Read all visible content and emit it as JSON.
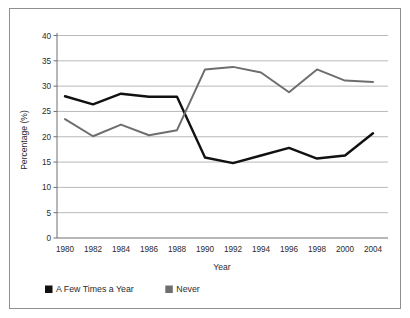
{
  "chart_data": {
    "type": "line",
    "title": "",
    "xlabel": "Year",
    "ylabel": "Percentage (%)",
    "categories": [
      "1980",
      "1982",
      "1984",
      "1986",
      "1988",
      "1990",
      "1992",
      "1994",
      "1996",
      "1998",
      "2000",
      "2004"
    ],
    "x": [
      1980,
      1982,
      1984,
      1986,
      1988,
      1990,
      1992,
      1994,
      1996,
      1998,
      2000,
      2004
    ],
    "series": [
      {
        "name": "A Few Times a Year",
        "color": "#111111",
        "values": [
          28.0,
          26.4,
          28.5,
          27.9,
          27.9,
          15.9,
          14.8,
          16.3,
          17.8,
          15.7,
          16.3,
          20.7
        ]
      },
      {
        "name": "Never",
        "color": "#6e6e6e",
        "values": [
          23.5,
          20.1,
          22.4,
          20.3,
          21.3,
          33.3,
          33.8,
          32.7,
          28.8,
          33.3,
          31.1,
          30.8
        ]
      }
    ],
    "ylim": [
      0,
      40
    ],
    "yticks": [
      0,
      5,
      10,
      15,
      20,
      25,
      30,
      35,
      40
    ],
    "ytick_labels": [
      "0",
      "5",
      "10",
      "15",
      "20",
      "25",
      "30",
      "35",
      "40"
    ],
    "grid": true,
    "grid_axis": "y",
    "legend_position": "bottom-left"
  },
  "axes": {
    "y_title": "Percentage (%)",
    "x_title": "Year",
    "y_tick_labels": [
      "40",
      "35",
      "30",
      "25",
      "20",
      "15",
      "10",
      "5",
      "0"
    ],
    "x_tick_labels": [
      "1980",
      "1982",
      "1984",
      "1986",
      "1988",
      "1990",
      "1992",
      "1994",
      "1996",
      "1998",
      "2000",
      "2004"
    ]
  },
  "legend": {
    "items": [
      {
        "label": "A Few Times a Year",
        "swatch_color": "#111111"
      },
      {
        "label": "Never",
        "swatch_color": "#6e6e6e"
      }
    ]
  },
  "colors": {
    "frame_border": "#8f8f8f",
    "grid_line": "#b9b9b9",
    "axis_line": "#808080",
    "background": "#ffffff",
    "series_a": "#111111",
    "series_b": "#6e6e6e",
    "text": "#2b2b2b"
  }
}
